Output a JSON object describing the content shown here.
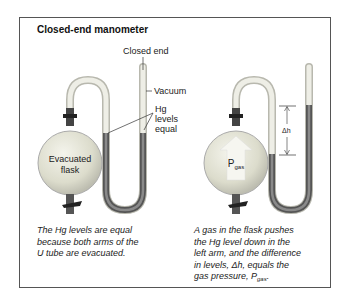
{
  "figure": {
    "title": "Closed-end manometer",
    "left_panel": {
      "labels": {
        "closed_end": "Closed end",
        "vacuum": "Vacuum",
        "hg_levels_1": "Hg",
        "hg_levels_2": "levels",
        "hg_levels_3": "equal",
        "flask_1": "Evacuated",
        "flask_2": "flask"
      },
      "caption_1": "The Hg levels are equal",
      "caption_2": "because both arms of the",
      "caption_3": "U tube are evacuated."
    },
    "right_panel": {
      "labels": {
        "delta_h": "Δh",
        "p": "P",
        "p_sub": "gas"
      },
      "caption_1": "A gas in the flask pushes",
      "caption_2": "the Hg level down in the",
      "caption_3": "left arm, and the difference",
      "caption_4": "in levels, Δh, equals the",
      "caption_5_pre": "gas pressure, P",
      "caption_5_sub": "gas"
    }
  },
  "colors": {
    "mercury": "#6a6a6a",
    "glass": "#e6e6dc",
    "glass_edge": "#b8b8ae",
    "flask": "#dcdccc",
    "frame": "#555555"
  }
}
